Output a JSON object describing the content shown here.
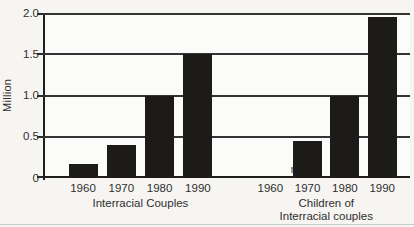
{
  "chart_data": {
    "type": "bar",
    "title": "",
    "ylabel": "Million",
    "ylim": [
      0,
      2.0
    ],
    "ytick_labels": [
      "2.0",
      "1.5",
      "1.0",
      "0.5",
      "0"
    ],
    "ytick_values": [
      2.0,
      1.5,
      1.0,
      0.5,
      0
    ],
    "grid": "full-width horizontal lines at each y tick",
    "legend": "none",
    "categories": [
      "1960",
      "1970",
      "1980",
      "1990"
    ],
    "groups": [
      {
        "label_lines": [
          "Interracial Couples"
        ],
        "values": [
          0.17,
          0.4,
          1.0,
          1.5
        ]
      },
      {
        "label_lines": [
          "Children of",
          "Interracial couples"
        ],
        "values": [
          null,
          0.45,
          1.0,
          1.95
        ],
        "missing_value_label": "n.a.",
        "missing_value_category": "1960"
      }
    ]
  },
  "colors": {
    "bar": "#1d1b19",
    "grid_line": "#343434",
    "axis_line": "#1f1f1f",
    "text": "#2e2e2e",
    "background": "#f6f5f2",
    "plot_background": "#fbfbf9"
  }
}
